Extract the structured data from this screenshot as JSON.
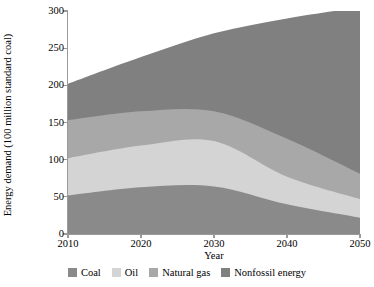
{
  "chart_data": {
    "type": "area",
    "title": "",
    "xlabel": "Year",
    "ylabel": "Energy demand (100 million standard coal)",
    "x": [
      2010,
      2020,
      2030,
      2040,
      2050
    ],
    "xlim": [
      2010,
      2050
    ],
    "ylim": [
      0,
      300
    ],
    "xticks": [
      "2010",
      "2020",
      "2030",
      "2040",
      "2050"
    ],
    "yticks": [
      "0",
      "50",
      "100",
      "150",
      "200",
      "250",
      "300"
    ],
    "grid": false,
    "stacked": true,
    "legend_position": "bottom",
    "series": [
      {
        "name": "Coal",
        "color": "#8a8a8a",
        "values": [
          52,
          63,
          64,
          40,
          22
        ]
      },
      {
        "name": "Oil",
        "color": "#d4d4d4",
        "values": [
          50,
          56,
          61,
          37,
          25
        ]
      },
      {
        "name": "Natural gas",
        "color": "#a8a8a8",
        "values": [
          51,
          46,
          40,
          51,
          34
        ]
      },
      {
        "name": "Nonfossil energy",
        "color": "#808080",
        "values": [
          49,
          73,
          105,
          162,
          224
        ]
      }
    ],
    "cumulative_tops": [
      [
        52,
        63,
        64,
        40,
        22
      ],
      [
        102,
        119,
        125,
        77,
        47
      ],
      [
        153,
        165,
        165,
        128,
        81
      ],
      [
        202,
        238,
        270,
        290,
        305
      ]
    ]
  },
  "axis": {
    "axis_color": "#9a9a9a"
  }
}
